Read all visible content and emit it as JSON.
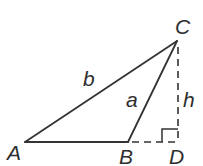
{
  "figure": {
    "type": "geometry-diagram",
    "colors": {
      "line": "#333333",
      "background": "#ffffff",
      "text": "#2e2e2e"
    },
    "vertex_labels": {
      "A": "A",
      "B": "B",
      "C": "C",
      "D": "D"
    },
    "side_labels": {
      "b": "b",
      "a": "a",
      "h": "h"
    },
    "edges": {
      "AB": "solid",
      "AC": "solid",
      "BC": "solid",
      "BD": "dashed",
      "CD": "dashed"
    },
    "right_angle_at": "D"
  }
}
